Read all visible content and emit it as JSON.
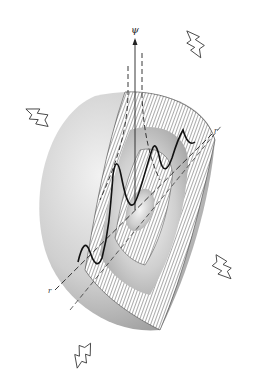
{
  "figure": {
    "labels": {
      "axis_psi": "ψ",
      "axis_r_upper": "r",
      "axis_r_lower": "r"
    },
    "colors": {
      "background": "#ffffff",
      "sphere_light": "#ececec",
      "sphere_dark": "#9a9a9a",
      "hatch": "#555555",
      "curve": "#111111"
    },
    "arrows": [
      {
        "name": "arrow-upper-right",
        "direction": "up-right"
      },
      {
        "name": "arrow-upper-left",
        "direction": "up-left"
      },
      {
        "name": "arrow-lower-right",
        "direction": "down-right"
      },
      {
        "name": "arrow-lower-left",
        "direction": "down-left"
      }
    ]
  }
}
